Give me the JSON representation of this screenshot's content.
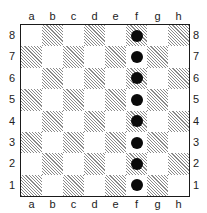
{
  "diagram": {
    "type": "chessboard",
    "files": [
      "a",
      "b",
      "c",
      "d",
      "e",
      "f",
      "g",
      "h"
    ],
    "ranks": [
      "8",
      "7",
      "6",
      "5",
      "4",
      "3",
      "2",
      "1"
    ],
    "square_style": {
      "light": "#ffffff",
      "dark": "hatched",
      "border": "#1a1a1a"
    },
    "pieces": [
      {
        "square": "f8",
        "shape": "black-disc"
      },
      {
        "square": "f7",
        "shape": "black-disc"
      },
      {
        "square": "f6",
        "shape": "black-disc"
      },
      {
        "square": "f5",
        "shape": "black-disc"
      },
      {
        "square": "f4",
        "shape": "black-disc"
      },
      {
        "square": "f3",
        "shape": "black-disc"
      },
      {
        "square": "f2",
        "shape": "black-disc"
      },
      {
        "square": "f1",
        "shape": "black-disc"
      }
    ],
    "piece_color": "#0a0a0a"
  }
}
